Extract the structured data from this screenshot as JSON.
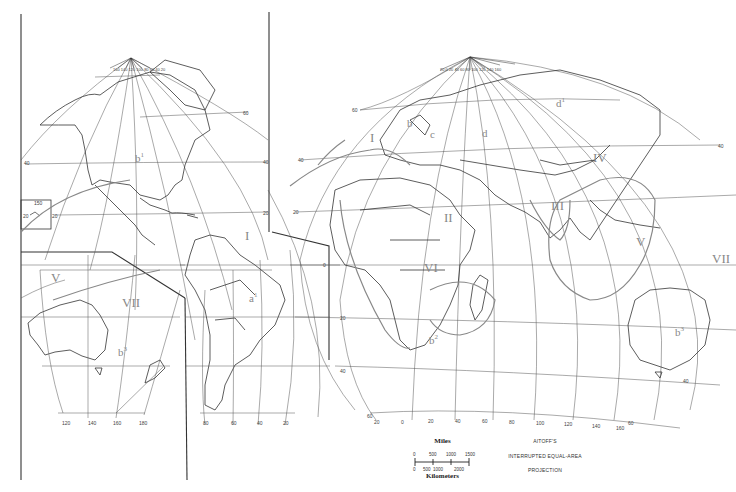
{
  "map": {
    "projection_title": [
      "AITOFF'S",
      "INTERRUPTED EQUAL-AREA",
      "PROJECTION"
    ],
    "scale": {
      "miles_label": "Miles",
      "kilometers_label": "Kilometers",
      "miles_ticks": [
        "0",
        "500",
        "1000",
        "1500"
      ],
      "km_ticks": [
        "0",
        "500",
        "1000",
        "2000"
      ]
    },
    "regions": [
      {
        "id": "I-atlantic",
        "label": "I"
      },
      {
        "id": "I-europe",
        "label": "I"
      },
      {
        "id": "II",
        "label": "II"
      },
      {
        "id": "III",
        "label": "III"
      },
      {
        "id": "IV",
        "label": "IV"
      },
      {
        "id": "V-asia",
        "label": "V"
      },
      {
        "id": "V-west",
        "label": "V"
      },
      {
        "id": "VI",
        "label": "VI"
      },
      {
        "id": "VII-pacific",
        "label": "VII"
      },
      {
        "id": "VII-east",
        "label": "VII"
      }
    ],
    "subregions": [
      {
        "id": "b1",
        "base": "b",
        "sup": "1"
      },
      {
        "id": "a1",
        "base": "a",
        "sup": "1"
      },
      {
        "id": "b3-left",
        "base": "b",
        "sup": "3"
      },
      {
        "id": "b3-right",
        "base": "b",
        "sup": "3"
      },
      {
        "id": "b",
        "base": "b",
        "sup": ""
      },
      {
        "id": "c",
        "base": "c",
        "sup": ""
      },
      {
        "id": "d",
        "base": "d",
        "sup": ""
      },
      {
        "id": "d1",
        "base": "d",
        "sup": "1"
      },
      {
        "id": "b2",
        "base": "b",
        "sup": "2"
      }
    ],
    "lat_labels": {
      "n60": "60",
      "n40": "40",
      "n20": "20",
      "eq": "0",
      "s20": "20",
      "s40": "40",
      "s60": "60"
    },
    "lon_labels_left_bottom": [
      "120",
      "140",
      "160",
      "180"
    ],
    "lon_labels_mid_bottom": [
      "80",
      "60",
      "40",
      "20"
    ],
    "lon_labels_right_bottom": [
      "20",
      "0",
      "20",
      "40",
      "60",
      "80",
      "100",
      "120",
      "140",
      "160"
    ],
    "pole_labels_na": "160 140 120 100 80 60 40 20",
    "pole_labels_eur": "20 0 20 40 60 80 100 120 140 160",
    "inset_labels": {
      "top": "150",
      "left": "20",
      "right": "20"
    },
    "colors": {
      "line": "#333333",
      "graticule": "#555555",
      "boundary": "#777777",
      "region_text": "#888888"
    }
  }
}
